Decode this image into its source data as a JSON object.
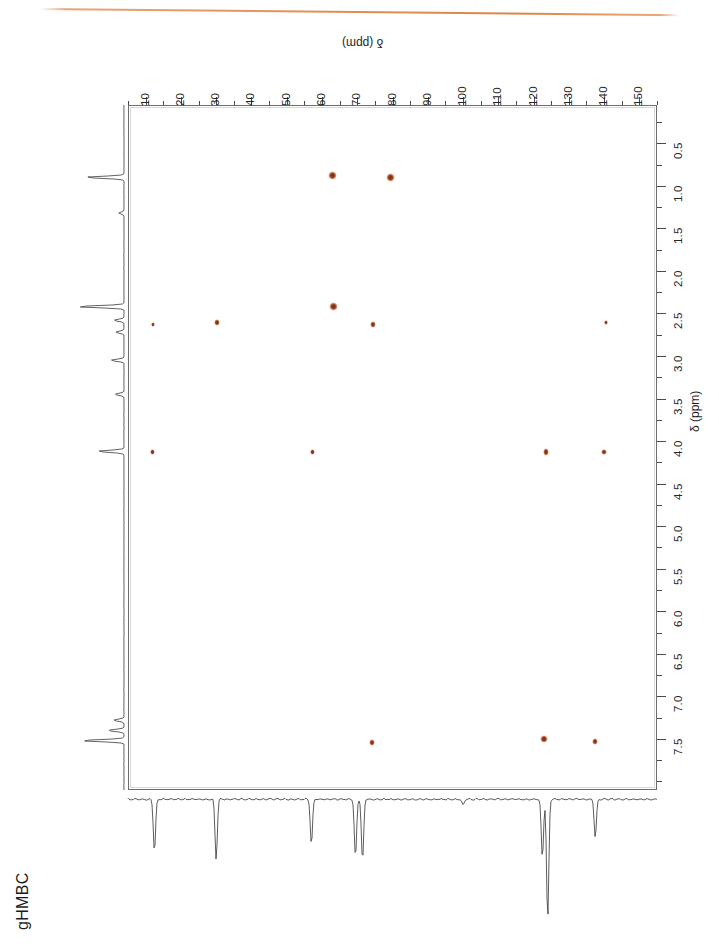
{
  "page": {
    "experiment_label": "gHMBC",
    "header_rule_color": "#dd8446",
    "background": "#ffffff"
  },
  "axes": {
    "carbon": {
      "title": "δ (ppm)",
      "unit": "ppm",
      "nucleus": "13C",
      "position": "top",
      "direction": "reversed-downfield-right",
      "min": 5,
      "max": 155,
      "tick_labels": [
        "10",
        "20",
        "30",
        "40",
        "50",
        "60",
        "70",
        "80",
        "90",
        "100",
        "110",
        "120",
        "130",
        "140",
        "150"
      ],
      "tick_values": [
        10,
        20,
        30,
        40,
        50,
        60,
        70,
        80,
        90,
        100,
        110,
        120,
        130,
        140,
        150
      ],
      "minor_tick_step": 5,
      "px_left": 128,
      "px_right": 657,
      "ppm_at_px_left": 5,
      "ppm_at_px_right": 155
    },
    "proton": {
      "title": "δ (ppm)",
      "unit": "ppm",
      "nucleus": "1H",
      "position": "right",
      "min": 0.15,
      "max": 8.2,
      "tick_labels": [
        "0.5",
        "1.0",
        "1.5",
        "2.0",
        "2.5",
        "3.0",
        "3.5",
        "4.0",
        "4.5",
        "5.0",
        "5.5",
        "6.0",
        "6.5",
        "7.0",
        "7.5"
      ],
      "tick_values": [
        0.5,
        1.0,
        1.5,
        2.0,
        2.5,
        3.0,
        3.5,
        4.0,
        4.5,
        5.0,
        5.5,
        6.0,
        6.5,
        7.0,
        7.5
      ],
      "minor_tick_step": 0.25,
      "px_top": 105,
      "px_bottom": 790,
      "ppm_at_px_top": 0.05,
      "ppm_at_px_bottom": 8.1
    }
  },
  "chart_data": {
    "type": "scatter",
    "title": "gHMBC",
    "xlabel": "δ (ppm)",
    "ylabel": "δ (ppm)",
    "xlim": [
      5,
      155
    ],
    "ylim": [
      8.1,
      0.05
    ],
    "grid": false,
    "legend": "none",
    "peak_color_core": "#6f2d18",
    "peak_color_halo": "#c97a52",
    "series": [
      {
        "name": "cross peaks",
        "points": [
          {
            "c": 63.0,
            "h": 0.88,
            "size": 8.5,
            "intensity": "strong"
          },
          {
            "c": 79.5,
            "h": 0.9,
            "size": 8.5,
            "intensity": "strong"
          },
          {
            "c": 63.3,
            "h": 2.42,
            "size": 9.0,
            "intensity": "strong"
          },
          {
            "c": 12.0,
            "h": 2.62,
            "size": 4.0,
            "intensity": "weak"
          },
          {
            "c": 30.2,
            "h": 2.6,
            "size": 5.5,
            "intensity": "medium"
          },
          {
            "c": 74.5,
            "h": 2.62,
            "size": 6.0,
            "intensity": "medium"
          },
          {
            "c": 140.5,
            "h": 2.6,
            "size": 4.5,
            "intensity": "weak"
          },
          {
            "c": 12.0,
            "h": 4.12,
            "size": 5.0,
            "intensity": "medium"
          },
          {
            "c": 57.3,
            "h": 4.12,
            "size": 5.5,
            "intensity": "medium"
          },
          {
            "c": 123.5,
            "h": 4.12,
            "size": 6.5,
            "intensity": "medium"
          },
          {
            "c": 140.0,
            "h": 4.12,
            "size": 5.5,
            "intensity": "medium"
          },
          {
            "c": 74.2,
            "h": 7.53,
            "size": 5.5,
            "intensity": "medium"
          },
          {
            "c": 123.0,
            "h": 7.5,
            "size": 8.0,
            "intensity": "strong"
          },
          {
            "c": 137.5,
            "h": 7.52,
            "size": 6.0,
            "intensity": "medium"
          }
        ]
      }
    ],
    "projections": {
      "proton_1d": {
        "orientation": "left-vertical",
        "peaks_ppm": [
          0.9,
          1.32,
          2.42,
          2.58,
          2.72,
          3.05,
          3.45,
          4.12,
          7.28,
          7.4,
          7.52
        ]
      },
      "carbon_1d": {
        "orientation": "bottom-horizontal",
        "peaks_ppm": [
          12.5,
          30.0,
          57.0,
          69.5,
          71.5,
          100.0,
          122.5,
          124.0,
          137.5
        ]
      }
    }
  }
}
